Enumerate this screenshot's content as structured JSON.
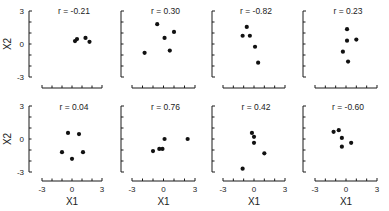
{
  "chart_data": {
    "type": "scatter",
    "title": "",
    "layout": {
      "rows": 2,
      "cols": 4
    },
    "xlabel": "X1",
    "ylabel": "X2",
    "xlim": [
      -3,
      3
    ],
    "ylim": [
      -3,
      3
    ],
    "xticks": [
      "-3",
      "0",
      "3"
    ],
    "yticks": [
      "3",
      "0",
      "-3"
    ],
    "grid": false,
    "panels": [
      {
        "label": "r = -0.21",
        "points": [
          [
            0.3,
            0.27
          ],
          [
            0.5,
            0.45
          ],
          [
            1.35,
            0.55
          ],
          [
            1.75,
            0.2
          ]
        ]
      },
      {
        "label": "r = 0.30",
        "points": [
          [
            -0.6,
            1.8
          ],
          [
            1.0,
            1.1
          ],
          [
            0.1,
            0.55
          ],
          [
            0.6,
            -0.6
          ],
          [
            -1.8,
            -0.8
          ]
        ]
      },
      {
        "label": "r = -0.82",
        "points": [
          [
            -0.7,
            1.55
          ],
          [
            -1.1,
            0.75
          ],
          [
            -0.4,
            0.75
          ],
          [
            0.1,
            -0.25
          ],
          [
            0.4,
            -1.7
          ]
        ]
      },
      {
        "label": "r = 0.23",
        "points": [
          [
            0.1,
            1.35
          ],
          [
            0.1,
            0.3
          ],
          [
            1.0,
            0.4
          ],
          [
            -0.3,
            -0.7
          ],
          [
            0.2,
            -1.6
          ]
        ]
      },
      {
        "label": "r = 0.04",
        "points": [
          [
            -0.4,
            0.55
          ],
          [
            0.7,
            0.45
          ],
          [
            -1.0,
            -1.2
          ],
          [
            1.1,
            -1.2
          ],
          [
            0.0,
            -1.8
          ]
        ]
      },
      {
        "label": "r = 0.76",
        "points": [
          [
            0.1,
            0.0
          ],
          [
            2.3,
            0.0
          ],
          [
            -1.0,
            -1.1
          ],
          [
            -0.4,
            -0.9
          ],
          [
            -0.1,
            -0.9
          ]
        ]
      },
      {
        "label": "r = 0.42",
        "points": [
          [
            -0.2,
            0.55
          ],
          [
            0.0,
            0.2
          ],
          [
            0.0,
            -0.35
          ],
          [
            1.0,
            -1.3
          ],
          [
            -1.1,
            -2.7
          ]
        ]
      },
      {
        "label": "r = -0.60",
        "points": [
          [
            -1.2,
            0.65
          ],
          [
            -0.7,
            0.8
          ],
          [
            -0.4,
            0.1
          ],
          [
            0.5,
            -0.35
          ],
          [
            -0.4,
            -0.7
          ]
        ]
      }
    ]
  }
}
